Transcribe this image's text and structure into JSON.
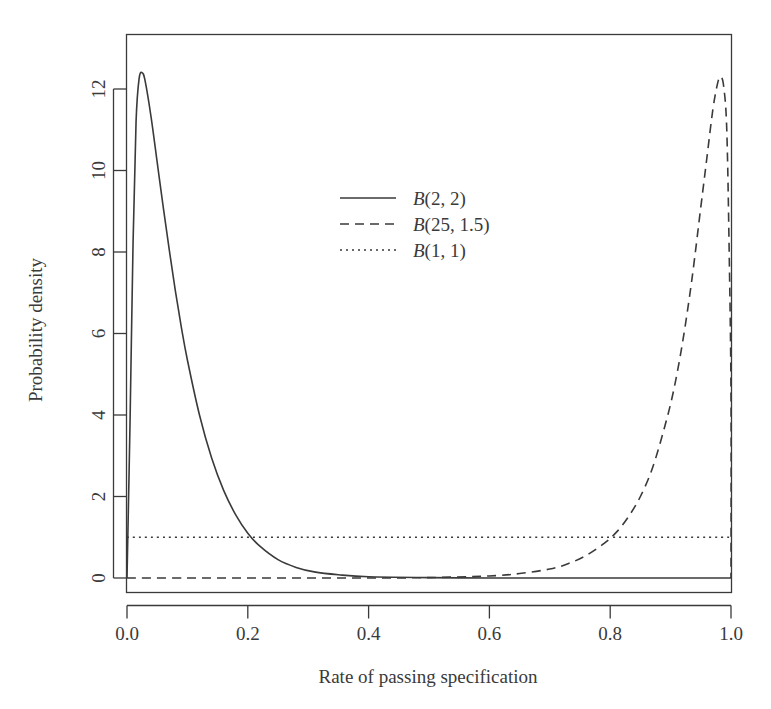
{
  "chart_data": {
    "type": "line",
    "title": "",
    "xlabel": "Rate of passing specification",
    "ylabel": "Probability density",
    "xlim": [
      0,
      1
    ],
    "ylim": [
      0,
      13
    ],
    "xticks": [
      "0.0",
      "0.2",
      "0.4",
      "0.6",
      "0.8",
      "1.0"
    ],
    "xtick_values": [
      0.0,
      0.2,
      0.4,
      0.6,
      0.8,
      1.0
    ],
    "yticks": [
      "0",
      "2",
      "4",
      "6",
      "8",
      "10",
      "12"
    ],
    "ytick_values": [
      0,
      2,
      4,
      6,
      8,
      10,
      12
    ],
    "grid": false,
    "legend_position": "upper center",
    "series": [
      {
        "name": "B(2, 2)",
        "linestyle": "solid",
        "color": "#3a3a3a",
        "peak_x": 0.025,
        "peak_y": 12.4,
        "x": [
          0.0,
          0.005,
          0.01,
          0.015,
          0.02,
          0.025,
          0.03,
          0.04,
          0.05,
          0.06,
          0.07,
          0.08,
          0.09,
          0.1,
          0.12,
          0.14,
          0.16,
          0.18,
          0.2,
          0.22,
          0.25,
          0.28,
          0.31,
          0.35,
          0.4,
          0.5,
          0.6,
          0.7,
          0.8,
          0.9,
          1.0
        ],
        "y": [
          0.0,
          3.8,
          8.2,
          11.2,
          12.25,
          12.4,
          12.2,
          11.3,
          10.2,
          9.1,
          8.05,
          7.05,
          6.15,
          5.35,
          4.0,
          2.95,
          2.15,
          1.55,
          1.1,
          0.78,
          0.45,
          0.26,
          0.15,
          0.08,
          0.03,
          0.01,
          0.0,
          0.0,
          0.0,
          0.0,
          0.0
        ]
      },
      {
        "name": "B(25, 1.5)",
        "linestyle": "dashed",
        "color": "#3a3a3a",
        "peak_x": 0.983,
        "peak_y": 12.3,
        "x": [
          0.0,
          0.1,
          0.2,
          0.3,
          0.4,
          0.5,
          0.6,
          0.65,
          0.7,
          0.73,
          0.76,
          0.79,
          0.81,
          0.83,
          0.85,
          0.87,
          0.89,
          0.905,
          0.92,
          0.935,
          0.95,
          0.96,
          0.97,
          0.978,
          0.983,
          0.988,
          0.993,
          0.997,
          1.0,
          1.0
        ],
        "y": [
          0.0,
          0.0,
          0.0,
          0.0,
          0.0,
          0.01,
          0.05,
          0.11,
          0.22,
          0.35,
          0.55,
          0.85,
          1.12,
          1.5,
          2.0,
          2.7,
          3.7,
          4.6,
          5.8,
          7.3,
          9.1,
          10.3,
          11.5,
          12.15,
          12.3,
          12.05,
          11.0,
          8.0,
          4.5,
          0.0
        ]
      },
      {
        "name": "B(1, 1)",
        "linestyle": "dotted",
        "color": "#3a3a3a",
        "constant_y": 1.0,
        "x": [
          0.0,
          1.0
        ],
        "y": [
          1.0,
          1.0
        ]
      }
    ],
    "legend": [
      {
        "label": "B(2, 2)",
        "linestyle": "solid"
      },
      {
        "label": "B(25, 1.5)",
        "linestyle": "dashed"
      },
      {
        "label": "B(1, 1)",
        "linestyle": "dotted"
      }
    ],
    "legend_math": [
      {
        "letter": "B",
        "args": "(2, 2)"
      },
      {
        "letter": "B",
        "args": "(25, 1.5)"
      },
      {
        "letter": "B",
        "args": "(1, 1)"
      }
    ]
  },
  "colors": {
    "background": "#ffffff",
    "ink": "#3a3a3a"
  }
}
